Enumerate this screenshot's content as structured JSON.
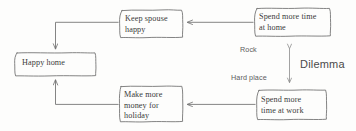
{
  "diagram": {
    "type": "flowchart",
    "style": "hand-drawn",
    "background_color": "#fdfdfc",
    "stroke_color": "#6e6e6e",
    "text_color": "#3b3b3b",
    "nodes": [
      {
        "id": "keep-spouse-happy",
        "label": "Keep spouse\nhappy",
        "shape": "rounded-rect"
      },
      {
        "id": "spend-more-time-at-home",
        "label": "Spend more time\nat home",
        "shape": "rounded-rect"
      },
      {
        "id": "happy-home",
        "label": "Happy home",
        "shape": "rounded-rect"
      },
      {
        "id": "make-more-money-for-holiday",
        "label": "Make more\nmoney for\nholiday",
        "shape": "rounded-rect"
      },
      {
        "id": "spend-more-time-at-work",
        "label": "Spend more\ntime at work",
        "shape": "rounded-rect"
      }
    ],
    "annotations": {
      "rock": "Rock",
      "hard_place": "Hard place",
      "dilemma": "Dilemma"
    },
    "edges": [
      {
        "from": "spend-more-time-at-home",
        "to": "keep-spouse-happy",
        "arrow": "single"
      },
      {
        "from": "keep-spouse-happy",
        "to": "happy-home",
        "arrow": "single"
      },
      {
        "from": "spend-more-time-at-work",
        "to": "make-more-money-for-holiday",
        "arrow": "single"
      },
      {
        "from": "make-more-money-for-holiday",
        "to": "happy-home",
        "arrow": "single"
      },
      {
        "from": "spend-more-time-at-home",
        "to": "spend-more-time-at-work",
        "arrow": "double"
      }
    ]
  }
}
